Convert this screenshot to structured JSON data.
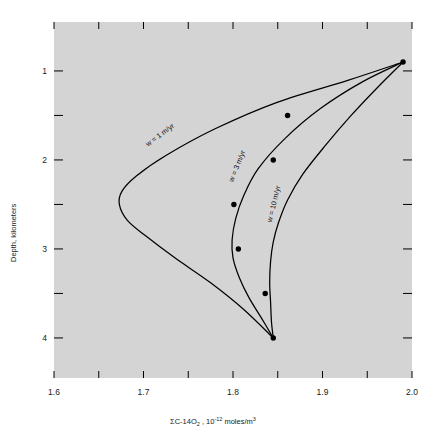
{
  "figure": {
    "background_color": "#d4d4d4",
    "page_color": "#ffffff",
    "curve_color": "#000000",
    "text_color": "#1a1a1a"
  },
  "axes": {
    "x_title_parts": {
      "sigma": "Σ",
      "species": "C-14O",
      "species_sub": "2",
      "separator": " , ",
      "mantissa": "10",
      "exponent": "-12",
      "units": " moles/m",
      "units_sup": "3"
    },
    "x_title_plain": "ΣC-14O₂ , 10⁻¹² moles/m³",
    "y_title": "Depth, kilometers",
    "x_tick_labels": [
      "1.6",
      "1.7",
      "1.8",
      "1.9",
      "2.0"
    ],
    "y_tick_labels": [
      "1",
      "2",
      "3",
      "4"
    ]
  },
  "chart_data": {
    "type": "line",
    "title": "",
    "xlabel": "ΣC-14O₂ , 10⁻¹² moles/m³",
    "ylabel": "Depth, kilometers",
    "xlim": [
      1.6,
      2.0
    ],
    "ylim": [
      4.45,
      0.45
    ],
    "y_inverted": true,
    "grid": false,
    "legend_position": "inline-curve-labels",
    "x_major_ticks": [
      1.6,
      1.7,
      1.8,
      1.9,
      2.0
    ],
    "x_minor_ticks": [
      1.65,
      1.75,
      1.85,
      1.95
    ],
    "y_major_ticks": [
      1,
      2,
      3,
      4
    ],
    "y_minor_ticks": [
      1.5,
      2.5,
      3.5
    ],
    "series": [
      {
        "name": "w = 1 m/yr",
        "label": "w = 1 m/yr",
        "label_position": {
          "x": 1.72,
          "depth": 1.74
        },
        "label_rotation_deg": -37,
        "x": [
          1.99,
          1.93,
          1.85,
          1.78,
          1.725,
          1.692,
          1.676,
          1.673,
          1.682,
          1.702,
          1.735,
          1.775,
          1.812,
          1.845
        ],
        "depth": [
          0.9,
          1.1,
          1.35,
          1.65,
          1.95,
          2.18,
          2.35,
          2.5,
          2.68,
          2.85,
          3.1,
          3.38,
          3.68,
          4.0
        ]
      },
      {
        "name": "w = 3 m/yr",
        "label": "w = 3 m/yr",
        "label_position": {
          "x": 1.807,
          "depth": 2.08
        },
        "label_rotation_deg": -68,
        "x": [
          1.99,
          1.945,
          1.898,
          1.858,
          1.828,
          1.812,
          1.803,
          1.799,
          1.8,
          1.807,
          1.818,
          1.832,
          1.845
        ],
        "depth": [
          0.9,
          1.12,
          1.42,
          1.76,
          2.1,
          2.4,
          2.66,
          2.9,
          3.1,
          3.32,
          3.55,
          3.78,
          4.0
        ]
      },
      {
        "name": "w = 10 m/yr",
        "label": "w = 10 m/yr",
        "label_position": {
          "x": 1.848,
          "depth": 2.5
        },
        "label_rotation_deg": -76,
        "x": [
          1.99,
          1.962,
          1.932,
          1.903,
          1.878,
          1.861,
          1.851,
          1.845,
          1.842,
          1.841,
          1.842,
          1.843,
          1.845
        ],
        "depth": [
          0.9,
          1.18,
          1.5,
          1.84,
          2.16,
          2.45,
          2.7,
          2.92,
          3.14,
          3.38,
          3.6,
          3.82,
          4.0
        ]
      }
    ],
    "data_points": [
      {
        "x": 1.861,
        "depth": 1.5
      },
      {
        "x": 1.845,
        "depth": 2.0
      },
      {
        "x": 1.801,
        "depth": 2.5
      },
      {
        "x": 1.806,
        "depth": 3.0
      },
      {
        "x": 1.836,
        "depth": 3.5
      },
      {
        "x": 1.99,
        "depth": 0.9
      },
      {
        "x": 1.845,
        "depth": 4.0
      }
    ],
    "convergence_points": {
      "top": {
        "x": 1.99,
        "depth": 0.9
      },
      "bottom": {
        "x": 1.845,
        "depth": 4.0
      }
    }
  }
}
